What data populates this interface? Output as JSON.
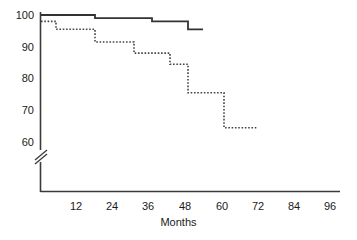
{
  "chart_data": {
    "type": "line",
    "title": "",
    "subtitle": "",
    "xlabel": "Months",
    "ylabel": "",
    "xlim": [
      0,
      99
    ],
    "ylim": [
      58,
      101
    ],
    "y_axis_break": true,
    "y_axis_break_below": 60,
    "grid": false,
    "legend": "none",
    "xticks": [
      12,
      24,
      36,
      48,
      60,
      72,
      84,
      96
    ],
    "yticks": [
      60,
      70,
      80,
      90,
      100
    ],
    "step_type": "post",
    "series": [
      {
        "name": "Group 1",
        "style": "solid",
        "color": "#333333",
        "x": [
          0,
          18,
          18,
          37,
          37,
          49,
          49,
          54
        ],
        "y": [
          100,
          100,
          99,
          99,
          98,
          98,
          95.5,
          95.5
        ]
      },
      {
        "name": "Group 2",
        "style": "dotted",
        "color": "#444444",
        "x": [
          0,
          5,
          5,
          18,
          18,
          25,
          25,
          31,
          31,
          43,
          43,
          49,
          49,
          61,
          61,
          72
        ],
        "y": [
          98,
          98,
          95.5,
          95.5,
          91.5,
          91.5,
          91.5,
          91.5,
          88,
          88,
          84.5,
          84.5,
          75.5,
          75.5,
          64.5,
          64.5
        ]
      }
    ]
  },
  "axes": {
    "y_tick_labels": [
      "100",
      "90",
      "80",
      "70",
      "60"
    ],
    "x_tick_labels": [
      "12",
      "24",
      "36",
      "48",
      "60",
      "72",
      "84",
      "96"
    ],
    "x_axis_title": "Months"
  }
}
